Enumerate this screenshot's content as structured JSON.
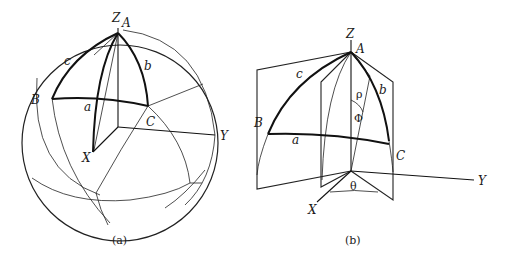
{
  "figure": {
    "panels": [
      {
        "id": "a",
        "caption": "(a)",
        "description": "Spherical triangle ABC on a unit sphere with axes X, Y, Z",
        "labels": {
          "Z": "Z",
          "A": "A",
          "B": "B",
          "C": "C",
          "X": "X",
          "Y": "Y",
          "side_a": "a",
          "side_b": "b",
          "side_c": "c"
        }
      },
      {
        "id": "b",
        "caption": "(b)",
        "description": "Spherical triangle ABC with planes and spherical angles rho, phi, theta",
        "labels": {
          "Z": "Z",
          "A": "A",
          "B": "B",
          "C": "C",
          "X": "X",
          "Y": "Y",
          "side_a": "a",
          "side_b": "b",
          "side_c": "c",
          "rho": "ρ",
          "phi": "Φ",
          "theta": "θ"
        }
      }
    ],
    "colors": {
      "line": "#111111",
      "background": "#ffffff"
    }
  }
}
